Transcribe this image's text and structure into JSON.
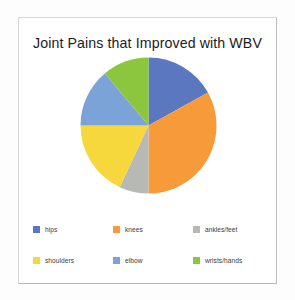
{
  "card": {
    "title": "Joint Pains that Improved with WBV",
    "background_color": "#ffffff",
    "border_color": "#b9b9b9"
  },
  "chart_data": {
    "type": "pie",
    "title": "Joint Pains that Improved with WBV",
    "xlabel": "",
    "ylabel": "",
    "legend_position": "bottom",
    "grid": false,
    "start_angle_deg": 0,
    "direction": "clockwise",
    "categories": [
      "hips",
      "knees",
      "ankles/feet",
      "shoulders",
      "elbow",
      "wrists/hands"
    ],
    "values": [
      17,
      33,
      7,
      18,
      14,
      11
    ],
    "unit": "percent",
    "colors": [
      "#5b77c0",
      "#f79b3a",
      "#b6b9b4",
      "#f7d83c",
      "#7ba3d8",
      "#8cc63f"
    ],
    "slices": [
      {
        "label": "hips",
        "value": 17,
        "color": "#5b77c0",
        "start_deg": 0,
        "end_deg": 61
      },
      {
        "label": "knees",
        "value": 33,
        "color": "#f79b3a",
        "start_deg": 61,
        "end_deg": 180
      },
      {
        "label": "ankles/feet",
        "value": 7,
        "color": "#b6b9b4",
        "start_deg": 180,
        "end_deg": 205
      },
      {
        "label": "shoulders",
        "value": 18,
        "color": "#f7d83c",
        "start_deg": 205,
        "end_deg": 270
      },
      {
        "label": "elbow",
        "value": 14,
        "color": "#7ba3d8",
        "start_deg": 270,
        "end_deg": 320
      },
      {
        "label": "wrists/hands",
        "value": 11,
        "color": "#8cc63f",
        "start_deg": 320,
        "end_deg": 360
      }
    ]
  },
  "legend": {
    "items": [
      {
        "label": "hips",
        "color": "#5b77c0"
      },
      {
        "label": "knees",
        "color": "#f79b3a"
      },
      {
        "label": "ankles/feet",
        "color": "#b6b9b4"
      },
      {
        "label": "shoulders",
        "color": "#f7d83c"
      },
      {
        "label": "elbow",
        "color": "#7ba3d8"
      },
      {
        "label": "wrists/hands",
        "color": "#8cc63f"
      }
    ]
  }
}
